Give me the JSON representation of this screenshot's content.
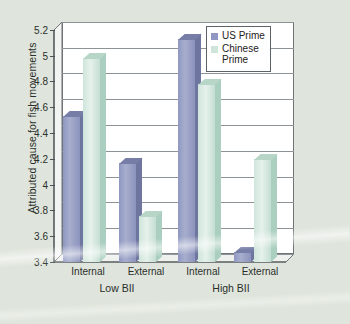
{
  "chart_data": {
    "type": "bar",
    "title": "",
    "xlabel": "",
    "ylabel": "Attributed cause for fish movements",
    "ylim": [
      3.4,
      5.2
    ],
    "yticks": [
      "3.4",
      "3.6",
      "3.8",
      "4",
      "4.2",
      "4.4",
      "4.6",
      "4.8",
      "5",
      "5.2"
    ],
    "grid": true,
    "legend_position": "top-right",
    "categories": [
      "Internal",
      "External",
      "Internal",
      "External"
    ],
    "groups": [
      {
        "label": "Low BII",
        "categories": [
          "Internal",
          "External"
        ]
      },
      {
        "label": "High BII",
        "categories": [
          "Internal",
          "External"
        ]
      }
    ],
    "series": [
      {
        "name": "US Prime",
        "color": "#8f97c2",
        "values": [
          4.53,
          4.17,
          5.13,
          3.48
        ]
      },
      {
        "name": "Chinese Prime",
        "color": "#cfe5dc",
        "values": [
          4.98,
          3.76,
          4.78,
          4.2
        ]
      }
    ]
  },
  "legend": {
    "items": [
      {
        "label": "US Prime"
      },
      {
        "label": "Chinese",
        "label2": "Prime"
      }
    ]
  },
  "axis": {
    "y_title": "Attributed cause for fish movements"
  },
  "colors": {
    "background": "#dfe5dc",
    "plot_background": "#ffffff",
    "gridline": "#8d9296",
    "axis": "#4c5155",
    "us_prime": "#8f97c2",
    "chinese_prime": "#cfe5dc",
    "text": "#2b2f2b"
  }
}
